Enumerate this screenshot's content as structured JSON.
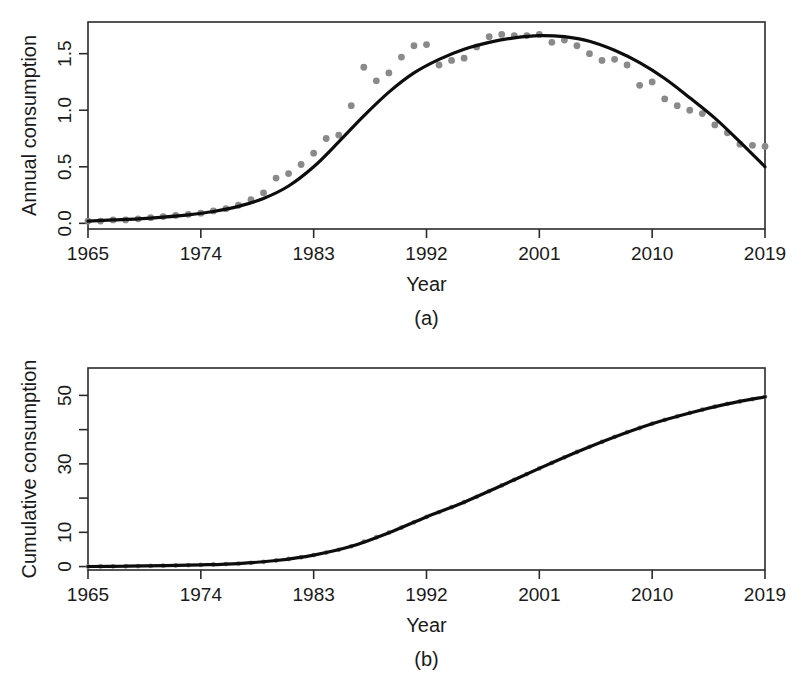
{
  "figure": {
    "background_color": "#ffffff",
    "point_color": "#8a8a8a",
    "line_color": "#0d0d0d",
    "axis_color": "#2b2b2b"
  },
  "panels": [
    {
      "caption": "(a)",
      "ylabel": "Annual consumption",
      "xlabel": "Year",
      "x_ticks": [
        "1965",
        "1974",
        "1983",
        "1992",
        "2001",
        "2010",
        "2019"
      ],
      "y_ticks": [
        "0.0",
        "0.5",
        "1.0",
        "1.5"
      ]
    },
    {
      "caption": "(b)",
      "ylabel": "Cumulative consumption",
      "xlabel": "Year",
      "x_ticks": [
        "1965",
        "1974",
        "1983",
        "1992",
        "2001",
        "2010",
        "2019"
      ],
      "y_ticks": [
        "0",
        "10",
        "30",
        "50"
      ]
    }
  ],
  "chart_data": [
    {
      "type": "scatter",
      "panel": "(a)",
      "title": "",
      "xlabel": "Year",
      "ylabel": "Annual consumption",
      "xlim": [
        1965,
        2019
      ],
      "ylim": [
        -0.05,
        1.78
      ],
      "xticks": [
        1965,
        1974,
        1983,
        1992,
        2001,
        2010,
        2019
      ],
      "xticklabels": [
        "1965",
        "1974",
        "1983",
        "1992",
        "2001",
        "2010",
        "2019"
      ],
      "yticks": [
        0.0,
        0.5,
        1.0,
        1.5
      ],
      "yticklabels": [
        "0.0",
        "0.5",
        "1.0",
        "1.5"
      ],
      "grid": false,
      "legend": "none",
      "series": [
        {
          "name": "Observed annual consumption",
          "marker": "filled-circle",
          "color": "#8a8a8a",
          "x": [
            1965,
            1966,
            1967,
            1968,
            1969,
            1970,
            1971,
            1972,
            1973,
            1974,
            1975,
            1976,
            1977,
            1978,
            1979,
            1980,
            1981,
            1982,
            1983,
            1984,
            1985,
            1986,
            1987,
            1988,
            1989,
            1990,
            1991,
            1992,
            1993,
            1994,
            1995,
            1996,
            1997,
            1998,
            1999,
            2000,
            2001,
            2002,
            2003,
            2004,
            2005,
            2006,
            2007,
            2008,
            2009,
            2010,
            2011,
            2012,
            2013,
            2014,
            2015,
            2016,
            2017,
            2018,
            2019
          ],
          "y": [
            0.02,
            0.02,
            0.03,
            0.03,
            0.04,
            0.05,
            0.06,
            0.07,
            0.08,
            0.09,
            0.11,
            0.13,
            0.16,
            0.21,
            0.27,
            0.4,
            0.44,
            0.52,
            0.62,
            0.75,
            0.78,
            1.04,
            1.38,
            1.26,
            1.33,
            1.47,
            1.57,
            1.58,
            1.4,
            1.44,
            1.46,
            1.56,
            1.65,
            1.67,
            1.66,
            1.66,
            1.67,
            1.6,
            1.62,
            1.57,
            1.5,
            1.44,
            1.45,
            1.4,
            1.22,
            1.25,
            1.1,
            1.04,
            1.0,
            0.97,
            0.87,
            0.8,
            0.7,
            0.69,
            0.68
          ]
        },
        {
          "name": "Fitted curve",
          "marker": "none",
          "color": "#0d0d0d",
          "x": [
            1965,
            1967,
            1969,
            1971,
            1973,
            1975,
            1977,
            1979,
            1981,
            1983,
            1985,
            1987,
            1989,
            1991,
            1993,
            1995,
            1997,
            1999,
            2001,
            2003,
            2005,
            2007,
            2009,
            2011,
            2013,
            2015,
            2017,
            2019
          ],
          "y": [
            0.02,
            0.03,
            0.04,
            0.055,
            0.075,
            0.105,
            0.15,
            0.22,
            0.33,
            0.5,
            0.72,
            0.95,
            1.16,
            1.33,
            1.45,
            1.54,
            1.6,
            1.64,
            1.66,
            1.65,
            1.61,
            1.53,
            1.42,
            1.28,
            1.11,
            0.93,
            0.72,
            0.5
          ]
        }
      ]
    },
    {
      "type": "line",
      "panel": "(b)",
      "title": "",
      "xlabel": "Year",
      "ylabel": "Cumulative consumption",
      "xlim": [
        1965,
        2019
      ],
      "ylim": [
        -1,
        58
      ],
      "xticks": [
        1965,
        1974,
        1983,
        1992,
        2001,
        2010,
        2019
      ],
      "xticklabels": [
        "1965",
        "1974",
        "1983",
        "1992",
        "2001",
        "2010",
        "2019"
      ],
      "yticks": [
        0,
        10,
        20,
        30,
        40,
        50
      ],
      "yticklabels": [
        "0",
        "10",
        "",
        "30",
        "",
        "50"
      ],
      "grid": false,
      "legend": "none",
      "series": [
        {
          "name": "Observed cumulative consumption",
          "marker": "filled-circle",
          "color": "#8a8a8a",
          "x": [
            1965,
            1966,
            1967,
            1968,
            1969,
            1970,
            1971,
            1972,
            1973,
            1974,
            1975,
            1976,
            1977,
            1978,
            1979,
            1980,
            1981,
            1982,
            1983,
            1984,
            1985,
            1986,
            1987,
            1988,
            1989,
            1990,
            1991,
            1992,
            1993,
            1994,
            1995,
            1996,
            1997,
            1998,
            1999,
            2000,
            2001,
            2002,
            2003,
            2004,
            2005,
            2006,
            2007,
            2008,
            2009,
            2010,
            2011,
            2012,
            2013,
            2014,
            2015,
            2016,
            2017,
            2018,
            2019
          ],
          "y": [
            0.02,
            0.04,
            0.07,
            0.1,
            0.14,
            0.19,
            0.25,
            0.32,
            0.4,
            0.49,
            0.6,
            0.73,
            0.89,
            1.1,
            1.37,
            1.77,
            2.21,
            2.73,
            3.35,
            4.1,
            4.88,
            5.92,
            7.3,
            8.56,
            9.89,
            11.36,
            12.93,
            14.51,
            15.91,
            17.35,
            18.81,
            20.37,
            22.02,
            23.69,
            25.35,
            27.01,
            28.68,
            30.28,
            31.9,
            33.47,
            34.97,
            36.41,
            37.86,
            39.26,
            40.48,
            41.73,
            42.83,
            43.87,
            44.87,
            45.84,
            46.71,
            47.51,
            48.21,
            48.9,
            49.58
          ]
        },
        {
          "name": "Fitted cumulative curve",
          "marker": "none",
          "color": "#0d0d0d",
          "x": [
            1965,
            1968,
            1971,
            1974,
            1977,
            1980,
            1983,
            1986,
            1989,
            1992,
            1995,
            1998,
            2001,
            2004,
            2007,
            2010,
            2013,
            2016,
            2019
          ],
          "y": [
            0.02,
            0.1,
            0.25,
            0.49,
            0.89,
            1.77,
            3.35,
            5.92,
            9.89,
            14.51,
            18.81,
            23.69,
            28.68,
            33.47,
            37.86,
            41.73,
            44.87,
            47.51,
            49.58
          ]
        }
      ]
    }
  ]
}
